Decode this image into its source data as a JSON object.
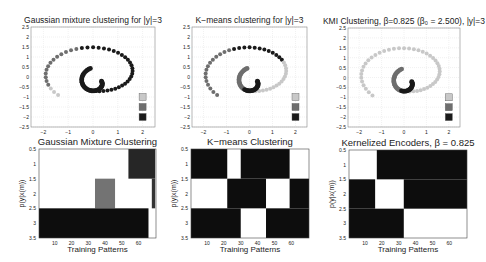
{
  "colors": {
    "cluster_light": "#c8c8c8",
    "cluster_mid": "#6e6e6e",
    "cluster_dark": "#1a1a1a",
    "axis": "#333333",
    "grid": "#e2e2e2",
    "heat_high": "#111111",
    "heat_low": "#ffffff"
  },
  "chart_data": [
    {
      "id": "gmm_scatter",
      "type": "scatter",
      "title": "Gaussian mixture clustering for |y|=3",
      "xlim": [
        -2.5,
        2.5
      ],
      "ylim": [
        -2.5,
        2.5
      ],
      "xticks": [
        -2,
        -1,
        0,
        1,
        2
      ],
      "yticks": [
        2.5,
        2,
        1.5,
        1,
        0.5,
        0,
        -0.5,
        -1,
        -1.5,
        -2,
        -2.5
      ],
      "grid": true,
      "legend": [
        "cluster 1",
        "cluster 2",
        "cluster 3"
      ],
      "labeling": "gmm",
      "box": {
        "x": 31,
        "y": 27,
        "w": 124,
        "h": 100
      }
    },
    {
      "id": "kmeans_scatter",
      "type": "scatter",
      "title": "K−means clustering for |y|=3",
      "xlim": [
        -2.5,
        2.5
      ],
      "ylim": [
        -2.5,
        2.5
      ],
      "xticks": [
        -2,
        -1,
        0,
        1,
        2
      ],
      "yticks": [
        2.5,
        2,
        1.5,
        1,
        0.5,
        0,
        -0.5,
        -1,
        -1.5,
        -2,
        -2.5
      ],
      "grid": true,
      "legend": [
        "cluster 1",
        "cluster 2",
        "cluster 3"
      ],
      "labeling": "kmeans",
      "box": {
        "x": 192,
        "y": 27,
        "w": 115,
        "h": 100
      }
    },
    {
      "id": "kmi_scatter",
      "type": "scatter",
      "title": "KMI Clustering, β=0.825 (β₀ = 2.500), |y|=3",
      "xlim": [
        -2.5,
        2.5
      ],
      "ylim": [
        -2.5,
        2.5
      ],
      "xticks": [
        -2,
        -1,
        0,
        1,
        2
      ],
      "yticks": [
        2.5,
        2,
        1.5,
        1,
        0.5,
        0,
        -0.5,
        -1,
        -1.5,
        -2,
        -2.5
      ],
      "grid": true,
      "legend": [
        "cluster 1",
        "cluster 2",
        "cluster 3"
      ],
      "labeling": "kmi",
      "box": {
        "x": 348,
        "y": 28,
        "w": 112,
        "h": 99
      }
    },
    {
      "id": "gmm_heatmap",
      "type": "heatmap",
      "title": "Gaussian Mixture Clustering",
      "xlabel": "Training Patterns",
      "ylabel": "p(y|x(m))",
      "xlim": [
        0.5,
        70.5
      ],
      "ylim": [
        0.5,
        3.5
      ],
      "xticks": [
        10,
        20,
        30,
        40,
        50,
        60
      ],
      "yticks": [
        0.5,
        1,
        1.5,
        2,
        2.5,
        3,
        3.5
      ],
      "rows": [
        [
          {
            "from": 54,
            "to": 70,
            "v": 0.85
          }
        ],
        [
          {
            "from": 34,
            "to": 46,
            "v": 0.55
          },
          {
            "from": 68,
            "to": 70,
            "v": 0.8
          }
        ],
        [
          {
            "from": 0.5,
            "to": 66,
            "v": 0.95
          }
        ]
      ],
      "box": {
        "x": 39,
        "y": 149,
        "w": 117,
        "h": 89
      }
    },
    {
      "id": "kmeans_heatmap",
      "type": "heatmap",
      "title": "K−means Clustering",
      "xlabel": "Training Patterns",
      "ylabel": "p(y|x(m))",
      "xlim": [
        0.5,
        70.5
      ],
      "ylim": [
        0.5,
        3.5
      ],
      "xticks": [
        10,
        20,
        30,
        40,
        50,
        60
      ],
      "yticks": [
        0.5,
        1,
        1.5,
        2,
        2.5,
        3,
        3.5
      ],
      "rows": [
        [
          {
            "from": 0.5,
            "to": 22,
            "v": 0.95
          },
          {
            "from": 30,
            "to": 59,
            "v": 0.95
          }
        ],
        [
          {
            "from": 22,
            "to": 45,
            "v": 0.95
          },
          {
            "from": 59,
            "to": 70.5,
            "v": 0.95
          }
        ],
        [
          {
            "from": 0.5,
            "to": 30,
            "v": 0.95
          },
          {
            "from": 45,
            "to": 70.5,
            "v": 0.95
          }
        ]
      ],
      "box": {
        "x": 191,
        "y": 149,
        "w": 118,
        "h": 89
      }
    },
    {
      "id": "ke_heatmap",
      "type": "heatmap",
      "title": "Kernelized Encoders, β = 0.825",
      "xlabel": "Training Patterns",
      "ylabel": "p(y|x(m))",
      "xlim": [
        0.5,
        70.5
      ],
      "ylim": [
        0.5,
        3.5
      ],
      "xticks": [
        10,
        20,
        30,
        40,
        50,
        60
      ],
      "yticks": [
        0.5,
        1,
        1.5,
        2,
        2.5,
        3,
        3.5
      ],
      "rows": [
        [
          {
            "from": 17,
            "to": 70.5,
            "v": 0.95
          }
        ],
        [
          {
            "from": 0.5,
            "to": 16,
            "v": 0.95
          },
          {
            "from": 33,
            "to": 70.5,
            "v": 0.95
          }
        ],
        [
          {
            "from": 0.5,
            "to": 33,
            "v": 0.95
          }
        ]
      ],
      "box": {
        "x": 349,
        "y": 150,
        "w": 118,
        "h": 88
      }
    }
  ]
}
